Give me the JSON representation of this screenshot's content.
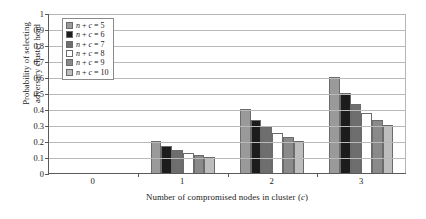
{
  "chart_data": {
    "type": "bar",
    "title": "",
    "xlabel": "Number of compromised nodes in cluster (c)",
    "xlabel_plain": "Number of compromised nodes in cluster",
    "xlabel_italic_var": "c",
    "ylabel": "Probability of selecting\nadversary cluster head",
    "categories": [
      "0",
      "1",
      "2",
      "3"
    ],
    "xticklabels": [
      "0",
      "1",
      "2",
      "3"
    ],
    "yticklabels": [
      "1",
      "0.9",
      "0.8",
      "0.7",
      "0.6",
      "0.5",
      "0.4",
      "0.3",
      "0.2",
      "0.1",
      "0"
    ],
    "ytickvalues": [
      1,
      0.9,
      0.8,
      0.7,
      0.6,
      0.5,
      0.4,
      0.3,
      0.2,
      0.1,
      0
    ],
    "ylim": [
      0,
      1
    ],
    "grid": true,
    "grid_axis": "y",
    "legend_position": "upper left",
    "series": [
      {
        "name": "n + c = 5",
        "color": "#9a9a9a",
        "values": [
          0,
          0.2,
          0.4,
          0.6
        ]
      },
      {
        "name": "n + c = 6",
        "color": "#1c1c1c",
        "values": [
          0,
          0.167,
          0.333,
          0.5
        ]
      },
      {
        "name": "n + c = 7",
        "color": "#6e6e6e",
        "values": [
          0,
          0.143,
          0.286,
          0.429
        ]
      },
      {
        "name": "n + c = 8",
        "color": "#ffffff",
        "values": [
          0,
          0.125,
          0.25,
          0.375
        ]
      },
      {
        "name": "n + c = 9",
        "color": "#8a8a8a",
        "values": [
          0,
          0.111,
          0.222,
          0.333
        ]
      },
      {
        "name": "n + c = 10",
        "color": "#bdbdbd",
        "values": [
          0,
          0.1,
          0.2,
          0.3
        ]
      }
    ],
    "legend": [
      {
        "label": "n + c = 5",
        "label_var": "n",
        "label_var2": "c",
        "label_value": "5",
        "color": "#9a9a9a"
      },
      {
        "label": "n + c = 6",
        "label_var": "n",
        "label_var2": "c",
        "label_value": "6",
        "color": "#1c1c1c"
      },
      {
        "label": "n + c = 7",
        "label_var": "n",
        "label_var2": "c",
        "label_value": "7",
        "color": "#6e6e6e"
      },
      {
        "label": "n + c = 8",
        "label_var": "n",
        "label_var2": "c",
        "label_value": "8",
        "color": "#ffffff"
      },
      {
        "label": "n + c = 9",
        "label_var": "n",
        "label_var2": "c",
        "label_value": "9",
        "color": "#8a8a8a"
      },
      {
        "label": "n + c = 10",
        "label_var": "n",
        "label_var2": "c",
        "label_value": "10",
        "color": "#bdbdbd"
      }
    ]
  },
  "colors": {
    "axis": "#5a5a5a",
    "grid": "#b9b9b9",
    "bar_outline": "#6b6b6b",
    "background": "#ffffff",
    "text": "#1a1a1a"
  }
}
